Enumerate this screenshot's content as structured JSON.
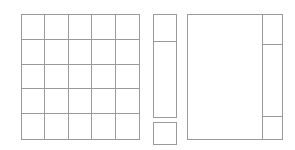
{
  "canvas": {
    "width": 295,
    "height": 150,
    "background_color": "#ffffff",
    "line_color": "#9a9a9a",
    "line_width_px": 1,
    "description": "Blank wireframe layout diagram with three outlined regions and no text labels"
  },
  "regions": [
    {
      "id": "grid-panel",
      "name": "left-grid-panel",
      "shape": "rectangle",
      "x": 21,
      "y": 14,
      "width": 119,
      "height": 126,
      "subdivision": "grid",
      "columns": 5,
      "rows": 5,
      "cell_count": 25,
      "label": ""
    },
    {
      "id": "middle-column",
      "name": "middle-column",
      "shape": "group",
      "x": 153,
      "y": 14,
      "width": 24,
      "height": 131,
      "parts": [
        {
          "id": "middle-stack",
          "name": "middle-stacked-panel",
          "x": 153,
          "y": 14,
          "width": 24,
          "height": 104,
          "rows": 2,
          "row_heights": [
            28,
            76
          ],
          "label": ""
        },
        {
          "id": "middle-detached",
          "name": "middle-detached-box",
          "x": 153,
          "y": 122,
          "width": 24,
          "height": 23,
          "label": ""
        }
      ]
    },
    {
      "id": "right-panel",
      "name": "right-panel",
      "shape": "rectangle",
      "x": 187,
      "y": 14,
      "width": 96,
      "height": 126,
      "parts": [
        {
          "id": "right-main",
          "name": "right-main-area",
          "x": 187,
          "y": 14,
          "width": 75,
          "height": 126,
          "label": ""
        },
        {
          "id": "right-sidebar",
          "name": "right-sidebar-column",
          "x": 262,
          "y": 14,
          "width": 21,
          "height": 126,
          "rows": 3,
          "row_heights": [
            30,
            74,
            22
          ],
          "label": ""
        }
      ]
    }
  ],
  "grid_cells": [
    {
      "row": 1,
      "col": 1,
      "label": ""
    },
    {
      "row": 1,
      "col": 2,
      "label": ""
    },
    {
      "row": 1,
      "col": 3,
      "label": ""
    },
    {
      "row": 1,
      "col": 4,
      "label": ""
    },
    {
      "row": 1,
      "col": 5,
      "label": ""
    },
    {
      "row": 2,
      "col": 1,
      "label": ""
    },
    {
      "row": 2,
      "col": 2,
      "label": ""
    },
    {
      "row": 2,
      "col": 3,
      "label": ""
    },
    {
      "row": 2,
      "col": 4,
      "label": ""
    },
    {
      "row": 2,
      "col": 5,
      "label": ""
    },
    {
      "row": 3,
      "col": 1,
      "label": ""
    },
    {
      "row": 3,
      "col": 2,
      "label": ""
    },
    {
      "row": 3,
      "col": 3,
      "label": ""
    },
    {
      "row": 3,
      "col": 4,
      "label": ""
    },
    {
      "row": 3,
      "col": 5,
      "label": ""
    },
    {
      "row": 4,
      "col": 1,
      "label": ""
    },
    {
      "row": 4,
      "col": 2,
      "label": ""
    },
    {
      "row": 4,
      "col": 3,
      "label": ""
    },
    {
      "row": 4,
      "col": 4,
      "label": ""
    },
    {
      "row": 4,
      "col": 5,
      "label": ""
    },
    {
      "row": 5,
      "col": 1,
      "label": ""
    },
    {
      "row": 5,
      "col": 2,
      "label": ""
    },
    {
      "row": 5,
      "col": 3,
      "label": ""
    },
    {
      "row": 5,
      "col": 4,
      "label": ""
    },
    {
      "row": 5,
      "col": 5,
      "label": ""
    }
  ],
  "middle_stack_cells": [
    {
      "index": 1,
      "height_px": 28,
      "label": ""
    },
    {
      "index": 2,
      "height_px": 76,
      "label": ""
    }
  ],
  "right_sidebar_cells": [
    {
      "index": 1,
      "height_px": 30,
      "label": ""
    },
    {
      "index": 2,
      "height_px": 74,
      "label": ""
    },
    {
      "index": 3,
      "height_px": 22,
      "label": ""
    }
  ]
}
